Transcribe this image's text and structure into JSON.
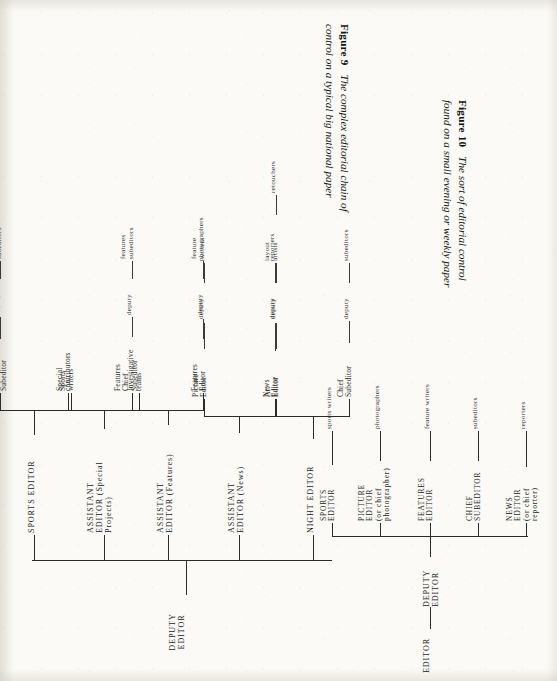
{
  "page": {
    "kind": "scanned-book-page",
    "orientation": "figures rotated 90 degrees counter-clockwise",
    "ink_color": "#2b2b2b",
    "paper_color": "#fbfaf6"
  },
  "figure9": {
    "caption_number": "Figure 9",
    "caption_text": "The complex editorial chain of control on a typical big national paper",
    "root": "DEPUTY\nEDITOR",
    "branches": [
      {
        "id": "night-editor",
        "label": "NIGHT EDITOR",
        "children": [
          {
            "label": "Chief\nSubeditor",
            "chain": [
              "deputy",
              "subeditors"
            ]
          },
          {
            "label": "Art\nEditor",
            "chain": [
              "deputy",
              "layout\nartists",
              "retouchers"
            ]
          }
        ]
      },
      {
        "id": "assistant-editor-news",
        "label": "ASSISTANT\nEDITOR (News)",
        "children": [
          {
            "label": "News\nEditor",
            "chain": [
              "deputy",
              "reporters"
            ]
          },
          {
            "label": "Picture\nEditor",
            "chain": [
              "deputy",
              "photographers"
            ]
          }
        ]
      },
      {
        "id": "assistant-editor-features",
        "label": "ASSISTANT\nEDITOR (Features)",
        "children": [
          {
            "label": "Features\nEditor",
            "chain": [
              "deputy",
              "feature\nwriters"
            ]
          },
          {
            "label": "Features\nChief\nSubeditor",
            "chain": [
              "deputy",
              "features\nsubeditors"
            ]
          }
        ]
      },
      {
        "id": "assistant-editor-special-projects",
        "label": "ASSISTANT\nEDITOR (Special\nProjects)",
        "children": [
          {
            "label": "Investigative\nteams",
            "chain": []
          },
          {
            "label": "Special\ncontributors",
            "chain": []
          }
        ]
      },
      {
        "id": "sports-editor",
        "label": "SPORTS EDITOR",
        "children": [
          {
            "label": "Sports\nwriters",
            "chain": []
          },
          {
            "label": "Sports\nChief\nSubeditor",
            "chain": [
              "deputy",
              "sports\nsubeditors"
            ]
          }
        ]
      }
    ]
  },
  "figure10": {
    "caption_number": "Figure 10",
    "caption_text": "The sort of editorial control found on a small evening or weekly paper",
    "root": "EDITOR",
    "second": "DEPUTY\nEDITOR",
    "branches": [
      {
        "id": "news-editor",
        "label": "NEWS\nEDITOR\n(or chief\nreporter)",
        "child": "reporters"
      },
      {
        "id": "chief-subeditor",
        "label": "CHIEF\nSUBEDITOR",
        "child": "subeditors"
      },
      {
        "id": "features-editor",
        "label": "FEATURES\nEDITOR",
        "child": "feature writers"
      },
      {
        "id": "picture-editor",
        "label": "PICTURE\nEDITOR\n(or chief\nphotographer)",
        "child": "photographers"
      },
      {
        "id": "sports-editor",
        "label": "SPORTS\nEDITOR",
        "child": "sports writers"
      }
    ]
  }
}
